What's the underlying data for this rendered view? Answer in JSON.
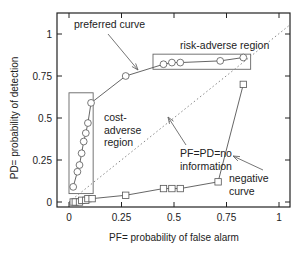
{
  "chart_data": {
    "type": "line",
    "title": "",
    "xlabel": "PF= probability of false alarm",
    "ylabel": "PD= probability of detection",
    "xlim": [
      0,
      1.05
    ],
    "ylim": [
      0,
      1.1
    ],
    "grid": false,
    "x_ticks": [
      {
        "value": 0,
        "label": "0"
      },
      {
        "value": 0.25,
        "label": "0.25"
      },
      {
        "value": 0.5,
        "label": "0.5"
      },
      {
        "value": 0.75,
        "label": "0.75"
      },
      {
        "value": 1,
        "label": "1"
      }
    ],
    "y_ticks": [
      {
        "value": 0,
        "label": "0"
      },
      {
        "value": 0.25,
        "label": "0.25"
      },
      {
        "value": 0.5,
        "label": "0.5"
      },
      {
        "value": 0.75,
        "label": "0.75"
      },
      {
        "value": 1,
        "label": "1"
      }
    ],
    "series": [
      {
        "name": "preferred curve",
        "marker": "circle",
        "points": [
          [
            0.02,
            0.09
          ],
          [
            0.04,
            0.18
          ],
          [
            0.05,
            0.22
          ],
          [
            0.06,
            0.29
          ],
          [
            0.07,
            0.36
          ],
          [
            0.08,
            0.41
          ],
          [
            0.09,
            0.47
          ],
          [
            0.105,
            0.59
          ],
          [
            0.27,
            0.75
          ],
          [
            0.45,
            0.82
          ],
          [
            0.49,
            0.83
          ],
          [
            0.53,
            0.83
          ],
          [
            0.72,
            0.84
          ],
          [
            0.83,
            0.86
          ]
        ]
      },
      {
        "name": "negative curve",
        "marker": "square",
        "points": [
          [
            0.02,
            0.0
          ],
          [
            0.03,
            0.0
          ],
          [
            0.05,
            0.0
          ],
          [
            0.06,
            0.01
          ],
          [
            0.08,
            0.01
          ],
          [
            0.09,
            0.02
          ],
          [
            0.11,
            0.02
          ],
          [
            0.27,
            0.04
          ],
          [
            0.45,
            0.08
          ],
          [
            0.49,
            0.08
          ],
          [
            0.53,
            0.08
          ],
          [
            0.71,
            0.12
          ],
          [
            0.83,
            0.7
          ]
        ]
      },
      {
        "name": "PF=PD=no information",
        "style": "dotted",
        "points": [
          [
            0,
            0
          ],
          [
            1.05,
            1.05
          ]
        ]
      }
    ],
    "regions": [
      {
        "name": "cost-adverse region",
        "pf": [
          0.0,
          0.115
        ],
        "pd": [
          0.05,
          0.65
        ]
      },
      {
        "name": "risk-adverse region",
        "pf": [
          0.4,
          0.865
        ],
        "pd": [
          0.79,
          0.88
        ]
      }
    ],
    "annotations": [
      {
        "text": [
          "preferred curve"
        ],
        "target": [
          0.33,
          0.78
        ]
      },
      {
        "text": [
          "risk-adverse region"
        ]
      },
      {
        "text": [
          "cost-",
          "adverse",
          "region"
        ]
      },
      {
        "text": [
          "PF=PD=no",
          "information"
        ],
        "target": [
          0.48,
          0.5
        ]
      },
      {
        "text": [
          "negative",
          "curve"
        ],
        "target": [
          0.78,
          0.28
        ]
      }
    ]
  }
}
